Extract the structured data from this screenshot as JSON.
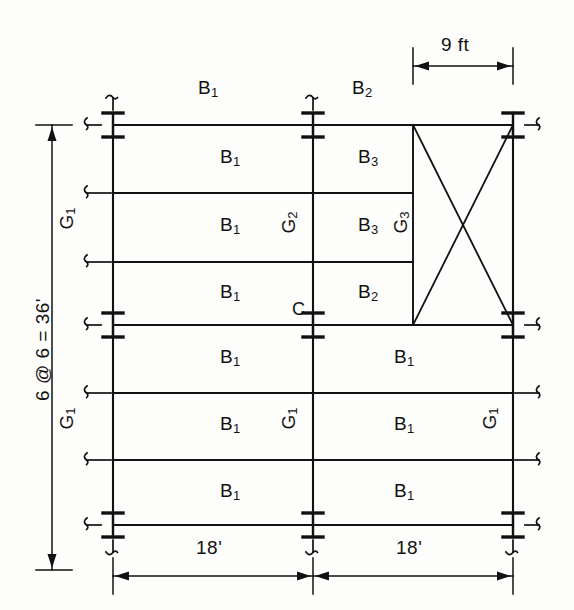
{
  "drawing": {
    "type": "structural-framing-plan",
    "title": "",
    "dimensions": {
      "left_vertical": "6 @ 6 = 36'",
      "top_right": "9 ft",
      "bottom_left_bay": "18'",
      "bottom_right_bay": "18'"
    },
    "beam_labels": [
      {
        "id": "b-top-left",
        "text": "B",
        "sub": "1",
        "x": 198,
        "y": 88
      },
      {
        "id": "b-top-right",
        "text": "B",
        "sub": "2",
        "x": 352,
        "y": 88
      },
      {
        "id": "b-r1-left",
        "text": "B",
        "sub": "1",
        "x": 220,
        "y": 157
      },
      {
        "id": "b-r1-right",
        "text": "B",
        "sub": "3",
        "x": 358,
        "y": 157
      },
      {
        "id": "b-r2-left",
        "text": "B",
        "sub": "1",
        "x": 220,
        "y": 225
      },
      {
        "id": "b-r2-right",
        "text": "B",
        "sub": "3",
        "x": 358,
        "y": 225
      },
      {
        "id": "b-r3-left",
        "text": "B",
        "sub": "1",
        "x": 220,
        "y": 292
      },
      {
        "id": "b-r3-right",
        "text": "B",
        "sub": "2",
        "x": 358,
        "y": 292
      },
      {
        "id": "b-r4-left",
        "text": "B",
        "sub": "1",
        "x": 220,
        "y": 357
      },
      {
        "id": "b-r4-right",
        "text": "B",
        "sub": "1",
        "x": 394,
        "y": 357
      },
      {
        "id": "b-r5-left",
        "text": "B",
        "sub": "1",
        "x": 220,
        "y": 424
      },
      {
        "id": "b-r5-right",
        "text": "B",
        "sub": "1",
        "x": 394,
        "y": 424
      },
      {
        "id": "b-r6-left",
        "text": "B",
        "sub": "1",
        "x": 220,
        "y": 491
      },
      {
        "id": "b-r6-right",
        "text": "B",
        "sub": "1",
        "x": 394,
        "y": 491
      }
    ],
    "girder_labels": [
      {
        "id": "g-left-upper",
        "text": "G",
        "sub": "1",
        "x": 66,
        "y": 218
      },
      {
        "id": "g-left-lower",
        "text": "G",
        "sub": "1",
        "x": 66,
        "y": 418
      },
      {
        "id": "g-center-upper",
        "text": "G",
        "sub": "2",
        "x": 288,
        "y": 222
      },
      {
        "id": "g-center-lower",
        "text": "G",
        "sub": "1",
        "x": 288,
        "y": 418
      },
      {
        "id": "g-brace-panel",
        "text": "G",
        "sub": "3",
        "x": 400,
        "y": 222
      },
      {
        "id": "g-right-lower",
        "text": "G",
        "sub": "1",
        "x": 489,
        "y": 418
      }
    ],
    "connection_labels": [
      {
        "id": "conn-c",
        "text": "C",
        "x": 292,
        "y": 310
      }
    ],
    "geometry": {
      "columns_x": [
        113,
        313,
        513
      ],
      "column_rows_y": [
        125,
        325,
        525
      ],
      "beam_lines_y": [
        125,
        193,
        262,
        325,
        393,
        460,
        525
      ],
      "brace_panel_left_x": 413,
      "brace_panel_top_y": 125,
      "brace_panel_bottom_y": 325
    }
  }
}
